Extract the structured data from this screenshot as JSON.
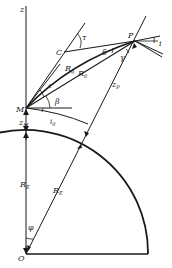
{
  "diagram": {
    "type": "geometry",
    "labels": {
      "z": "z",
      "C": "C",
      "tau": "τ",
      "P": "P",
      "i": "i",
      "Rg": "R",
      "Rg_sub": "g",
      "delta": "δ",
      "gamma": "γ",
      "R0": "R",
      "R0_sub": "0",
      "epsilon": "ε",
      "zP": "z",
      "zP_sub": "P",
      "M": "M",
      "beta": "β",
      "i0": "i",
      "i0_sub": "0",
      "zM": "z",
      "zM_sub": "M",
      "RE_left": "R",
      "RE_left_sub": "E",
      "RE_right": "R",
      "RE_right_sub": "E",
      "phi": "φ",
      "O": "O"
    },
    "colors": {
      "stroke": "#1a1a1a",
      "background": "#ffffff"
    }
  }
}
